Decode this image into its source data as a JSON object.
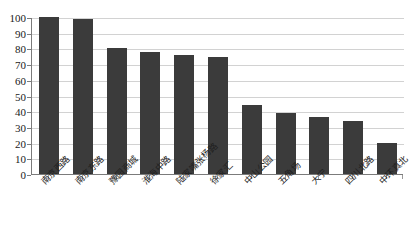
{
  "chart_data": {
    "type": "bar",
    "title": "",
    "subtitle": "",
    "xlabel": "",
    "ylabel": "",
    "categories": [
      "南京西路",
      "南京东路",
      "豫园商城",
      "淮海中路",
      "陆家嘴张杨路",
      "徐家汇",
      "中山公园",
      "五角场",
      "大宁",
      "四川北路",
      "中环真北"
    ],
    "values": [
      100,
      99,
      80,
      77.5,
      75.5,
      74.5,
      44,
      39,
      36.5,
      34,
      20
    ],
    "ylim": [
      0,
      100
    ],
    "yticks": [
      0,
      10,
      20,
      30,
      40,
      50,
      60,
      70,
      80,
      90,
      100
    ],
    "ytick_labels": [
      "0",
      "10",
      "20",
      "30",
      "40",
      "50",
      "60",
      "70",
      "80",
      "90",
      "100"
    ],
    "grid": true,
    "legend": false,
    "legend_position": "none",
    "series": [
      {
        "name": "",
        "color": "#3b3b3b",
        "values": [
          100,
          99,
          80,
          77.5,
          75.5,
          74.5,
          44,
          39,
          36.5,
          34,
          20
        ]
      }
    ]
  },
  "colors": {
    "bar": "#3b3b3b",
    "grid": "#d2d2d2",
    "axis": "#7b7b7b",
    "text": "#1a1a1a",
    "background": "#ffffff"
  }
}
